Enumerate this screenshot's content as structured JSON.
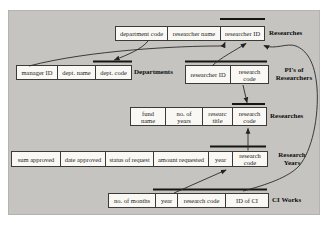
{
  "figure": {
    "title_hint": "relational schema diagram",
    "colors": {
      "panel_bg": "#c5c4c1",
      "cell_bg": "#f9f8f4",
      "line": "#2a2a28",
      "key_bar": "#151513"
    },
    "tables": {
      "researches_top": {
        "label": "Researches",
        "cells": [
          {
            "line1": "department code"
          },
          {
            "line1": "researcher name"
          },
          {
            "line1": "researcher ID"
          }
        ]
      },
      "departments": {
        "label": "Departments",
        "cells": [
          {
            "line1": "manager ID"
          },
          {
            "line1": "dept. name"
          },
          {
            "line1": "dept. code"
          }
        ]
      },
      "pis_of_researchers": {
        "label": {
          "line1": "PI's of",
          "line2": "Researchers"
        },
        "cells": [
          {
            "line1": "researcher ID"
          },
          {
            "line1": "research",
            "line2": "code"
          }
        ]
      },
      "researches": {
        "label": "Researches",
        "cells": [
          {
            "line1": "fund",
            "line2": "name"
          },
          {
            "line1": "no. of",
            "line2": "years"
          },
          {
            "line1": "researc",
            "line2": "title"
          },
          {
            "line1": "research",
            "line2": "code"
          }
        ]
      },
      "research_years": {
        "label": {
          "line1": "Research",
          "line2": "Years"
        },
        "cells": [
          {
            "line1": "sum approved"
          },
          {
            "line1": "date approved"
          },
          {
            "line1": "status of request"
          },
          {
            "line1": "amount requested"
          },
          {
            "line1": "year"
          },
          {
            "line1": "research",
            "line2": "code"
          }
        ]
      },
      "ci_works": {
        "label": "CI Works",
        "cells": [
          {
            "line1": "no. of months"
          },
          {
            "line1": "year"
          },
          {
            "line1": "research code"
          },
          {
            "line1": "ID of CI"
          }
        ]
      }
    },
    "key_bars": [
      "researches_top: researcher ID",
      "departments: dept. code",
      "pis_of_researchers: researcher ID + research code",
      "researches: research code",
      "research_years: year + research code",
      "ci_works: year + research code + ID of CI"
    ],
    "relationships": [
      {
        "from": "Departments.manager ID",
        "to": "Researches(top).researcher ID"
      },
      {
        "from": "Researches(top).department code",
        "to": "Departments.dept. code"
      },
      {
        "from": "PI's of Researchers.researcher ID",
        "to": "Researches(top).researcher ID"
      },
      {
        "from": "PI's of Researchers.research code",
        "to": "Researches.research code"
      },
      {
        "from": "Research Years.research code",
        "to": "Researches.research code"
      },
      {
        "from": "CI Works.year + research code",
        "to": "Research Years.year + research code"
      },
      {
        "from": "CI Works.ID of CI",
        "to": "Researches(top).researcher ID"
      }
    ]
  }
}
